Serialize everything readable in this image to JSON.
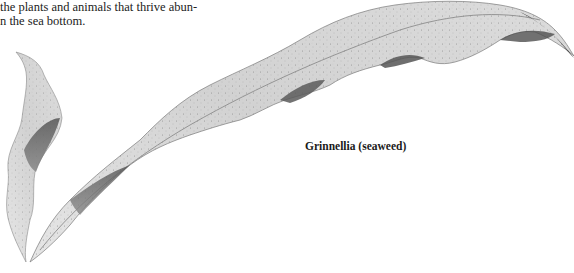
{
  "document": {
    "body_text_lines": [
      "the plants and animals that thrive abun-",
      "n the sea bottom."
    ],
    "figure": {
      "caption": "Grinnellia (seaweed)",
      "subject": "seaweed-illustration",
      "style": "grayscale stippled drawing"
    }
  }
}
